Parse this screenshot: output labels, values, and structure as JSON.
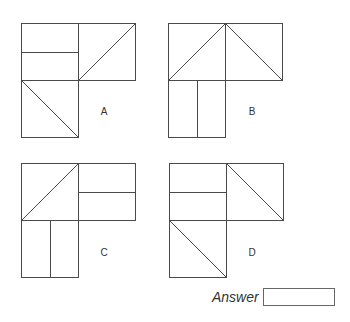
{
  "options": [
    {
      "label": "A",
      "label_pos": [
        104,
        111
      ],
      "origin": [
        21,
        23
      ],
      "cells": {
        "top_left": "horizontal-split",
        "top_right": "diagonal-bl-tr",
        "bottom_left": "diagonal-tl-br"
      }
    },
    {
      "label": "B",
      "label_pos": [
        252,
        111
      ],
      "origin": [
        168,
        23
      ],
      "cells": {
        "top_left": "diagonal-bl-tr",
        "top_right": "diagonal-tl-br",
        "bottom_left": "vertical-split"
      }
    },
    {
      "label": "C",
      "label_pos": [
        104,
        252
      ],
      "origin": [
        21,
        163
      ],
      "cells": {
        "top_left": "diagonal-bl-tr",
        "top_right": "horizontal-split",
        "bottom_left": "vertical-split"
      }
    },
    {
      "label": "D",
      "label_pos": [
        252,
        252
      ],
      "origin": [
        169,
        163
      ],
      "cells": {
        "top_left": "horizontal-split",
        "top_right": "diagonal-tl-br",
        "bottom_left": "diagonal-tl-br"
      }
    }
  ],
  "answer": {
    "label": "Answer",
    "value": ""
  },
  "colors": {
    "line": "#4a4a4a"
  }
}
